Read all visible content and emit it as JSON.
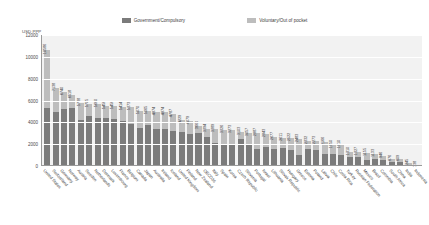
{
  "legend": {
    "items": [
      {
        "label": "Government/Compulsory",
        "color": "#7b7b7b",
        "key": "government"
      },
      {
        "label": "Voluntary/Out of pocket",
        "color": "#bdbdbd",
        "key": "voluntary"
      }
    ]
  },
  "chart_data": {
    "type": "bar",
    "subtype": "stacked-bar",
    "title": "",
    "xlabel": "",
    "ylabel": "USD PPP",
    "ylim": [
      0,
      12000
    ],
    "yticks": [
      0,
      2000,
      4000,
      6000,
      8000,
      10000,
      12000
    ],
    "ytick_labels": [
      "0",
      "2000",
      "4000",
      "6000",
      "8000",
      "10000",
      "12000"
    ],
    "grid": true,
    "legend_position": "top-center",
    "categories": [
      "United States",
      "Switzerland",
      "Germany",
      "Norway",
      "Austria",
      "Sweden",
      "Netherlands",
      "Denmark",
      "Luxembourg",
      "France",
      "Belgium",
      "Canada",
      "Japan",
      "Australia",
      "Ireland",
      "Iceland",
      "United Kingdom",
      "Finland",
      "New Zealand",
      "OECD36",
      "Italy",
      "Spain",
      "Korea",
      "Czech Republic",
      "Slovenia",
      "Portugal",
      "Israel",
      "Lithuania",
      "Slovak Republic",
      "Hungary",
      "Greece",
      "Estonia",
      "Poland",
      "Latvia",
      "Chile",
      "Costa Rica",
      "Turkey",
      "Russian Federation",
      "Mexico",
      "Brazil",
      "Colombia",
      "South Africa",
      "China",
      "India",
      "Indonesia"
    ],
    "series": [
      {
        "name": "Government/Compulsory",
        "color": "#7b7b7b",
        "values": [
          5335,
          4988,
          5251,
          5284,
          4254,
          4603,
          4407,
          4437,
          4296,
          4130,
          3871,
          3469,
          3792,
          3413,
          3405,
          3232,
          3138,
          2913,
          2993,
          2680,
          2094,
          1962,
          1988,
          2499,
          2041,
          1543,
          1719,
          1533,
          1658,
          1489,
          1048,
          1523,
          1439,
          1106,
          1085,
          980,
          848,
          805,
          530,
          617,
          515,
          370,
          328,
          126,
          77
        ]
      },
      {
        "name": "Voluntary/Out of pocket",
        "color": "#bdbdbd",
        "values": [
          5251,
          2150,
          1489,
          1234,
          1484,
          1102,
          1253,
          1019,
          1160,
          1284,
          1502,
          1601,
          1273,
          1561,
          1569,
          1555,
          1091,
          1166,
          667,
          714,
          1295,
          1364,
          1285,
          604,
          1016,
          1444,
          1224,
          1144,
          953,
          1033,
          1435,
          809,
          834,
          1060,
          865,
          930,
          462,
          522,
          625,
          516,
          431,
          306,
          281,
          119,
          61
        ]
      }
    ],
    "totals": [
      10586,
      7138,
      6740,
      6518,
      5738,
      5705,
      5660,
      5456,
      5456,
      5414,
      5373,
      5070,
      5065,
      4974,
      4974,
      4787,
      4229,
      4079,
      3660,
      3394,
      3389,
      3326,
      3273,
      3103,
      3057,
      2987,
      2943,
      2677,
      2611,
      2522,
      2483,
      2332,
      2273,
      2166,
      1950,
      1910,
      1310,
      1327,
      1155,
      1133,
      946,
      676,
      609,
      245,
      138
    ],
    "data_labels": [
      "10586",
      "7138",
      "6740",
      "6518",
      "5738",
      "5705",
      "5660",
      "5456",
      "5456",
      "5414",
      "5373",
      "5070",
      "5065",
      "4974",
      "4974",
      "4787",
      "4229",
      "4079",
      "3660",
      "3394",
      "3389",
      "3326",
      "3273",
      "3103",
      "3057",
      "2987",
      "2943",
      "2677",
      "2611",
      "2522",
      "2483",
      "2332",
      "2273",
      "2166",
      "1950",
      "1910",
      "1310",
      "1327",
      "1155",
      "1133",
      "946",
      "676",
      "609",
      "245",
      "138"
    ]
  }
}
